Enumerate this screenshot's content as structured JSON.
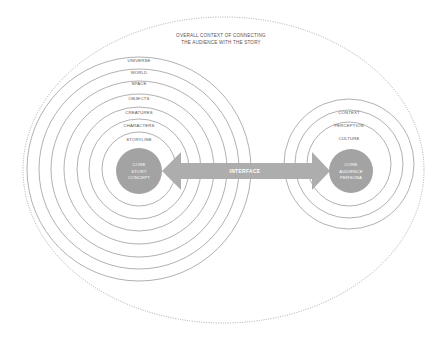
{
  "diagram": {
    "title_lines": [
      "OVERALL CONTEXT OF CONNECTING",
      "THE AUDIENCE WITH THE STORY"
    ],
    "colors": {
      "ring_stroke": "#8a8a8a",
      "ellipse_stroke": "#9a9a9a",
      "core_fill": "#a3a3a3",
      "arrow_fill": "#adadad",
      "label_text": "#555555",
      "core_text": "#ffffff"
    },
    "story": {
      "rings": [
        {
          "label": "UNIVERSE"
        },
        {
          "label": "WORLD"
        },
        {
          "label": "SPACE"
        },
        {
          "label": "OBJECTS"
        },
        {
          "label": "CREATURES"
        },
        {
          "label": "CHARACTERS"
        },
        {
          "label": "STORYLINE"
        }
      ],
      "core_lines": [
        "CORE",
        "STORY",
        "CONCEPT"
      ]
    },
    "audience": {
      "rings": [
        {
          "label": "CONTEXT"
        },
        {
          "label": "PERCEPTION"
        },
        {
          "label": "CULTURE"
        }
      ],
      "core_lines": [
        "CORE",
        "AUDIENCE",
        "PERSONA"
      ]
    },
    "connector": {
      "label": "INTERFACE",
      "direction": "bidirectional"
    }
  }
}
